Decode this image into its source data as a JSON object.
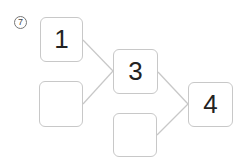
{
  "problem": {
    "number": "7",
    "boxes": {
      "top_left": "1",
      "bottom_left": "",
      "middle": "3",
      "bottom_middle": "",
      "result": "4"
    },
    "colors": {
      "box_border": "#c8c8c8",
      "connector": "#c8c8c8",
      "text": "#222222"
    }
  }
}
